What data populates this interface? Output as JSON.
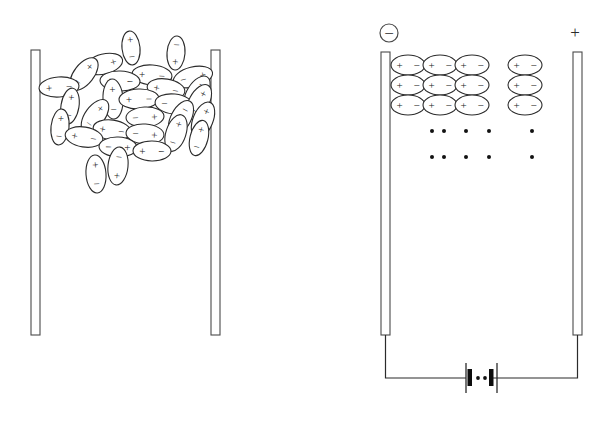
{
  "figure": {
    "panels": [
      {
        "id": "unpolarized",
        "name": "left-panel-unpolarized-dielectric",
        "description": "Randomly oriented polar molecules between two uncharged plates",
        "plates": [
          {
            "name": "left-plate",
            "x": 31,
            "y": 50,
            "width": 9,
            "height": 285
          },
          {
            "name": "right-plate",
            "x": 211,
            "y": 50,
            "width": 9,
            "height": 285
          }
        ],
        "dipole_count": 43,
        "dipole_charges": [
          "+",
          "−"
        ]
      },
      {
        "id": "polarized",
        "name": "right-panel-polarized-dielectric",
        "description": "Aligned dipoles between charged plates connected to a battery",
        "plates": [
          {
            "name": "negative-plate",
            "x": 381,
            "y": 52,
            "width": 9,
            "height": 283
          },
          {
            "name": "positive-plate",
            "x": 573,
            "y": 52,
            "width": 9,
            "height": 283
          }
        ],
        "terminals": [
          {
            "name": "negative-terminal",
            "label": "−",
            "circled": true,
            "x": 389,
            "y": 33
          },
          {
            "name": "positive-terminal",
            "label": "+",
            "circled": false,
            "x": 575,
            "y": 32
          }
        ],
        "dipole_rows": 3,
        "dipole_cols": 4,
        "dipole_charges": [
          "+",
          "−"
        ],
        "ion_dot_rows": 2,
        "ion_dot_cols": 5,
        "battery": {
          "name": "battery-symbol",
          "cells": 2,
          "x": 477,
          "y": 378
        }
      }
    ],
    "colors": {
      "ink": "#2b2b2b",
      "plate_stroke": "#4a4a4a",
      "background": "#ffffff",
      "dot": "#121212"
    }
  },
  "left_dipoles": [
    {
      "cx": 131,
      "cy": 48,
      "rx": 9,
      "ry": 17,
      "rot": -6,
      "plus": "+",
      "minus": "−"
    },
    {
      "cx": 176,
      "cy": 53,
      "rx": 9,
      "ry": 17,
      "rot": 4,
      "plus": "−",
      "minus": "+"
    },
    {
      "cx": 104,
      "cy": 64,
      "rx": 19,
      "ry": 10,
      "rot": -14,
      "plus": "−",
      "minus": "+"
    },
    {
      "cx": 152,
      "cy": 75,
      "rx": 20,
      "ry": 10,
      "rot": 4,
      "plus": "+",
      "minus": "−"
    },
    {
      "cx": 84,
      "cy": 74,
      "rx": 10,
      "ry": 19,
      "rot": 38,
      "plus": "+",
      "minus": "−"
    },
    {
      "cx": 193,
      "cy": 77,
      "rx": 20,
      "ry": 10,
      "rot": -14,
      "plus": "−",
      "minus": "+"
    },
    {
      "cx": 59,
      "cy": 87,
      "rx": 20,
      "ry": 10,
      "rot": -4,
      "plus": "+",
      "minus": "−"
    },
    {
      "cx": 120,
      "cy": 81,
      "rx": 20,
      "ry": 10,
      "rot": 2,
      "plus": "+",
      "minus": "−"
    },
    {
      "cx": 166,
      "cy": 89,
      "rx": 19,
      "ry": 10,
      "rot": 9,
      "plus": "+",
      "minus": "−"
    },
    {
      "cx": 197,
      "cy": 93,
      "rx": 10,
      "ry": 19,
      "rot": 32,
      "plus": "−",
      "minus": "+"
    },
    {
      "cx": 70,
      "cy": 106,
      "rx": 9,
      "ry": 18,
      "rot": 9,
      "plus": "+",
      "minus": "−"
    },
    {
      "cx": 113,
      "cy": 99,
      "rx": 10,
      "ry": 20,
      "rot": -3,
      "plus": "+",
      "minus": "−"
    },
    {
      "cx": 139,
      "cy": 99,
      "rx": 20,
      "ry": 10,
      "rot": -2,
      "plus": "+",
      "minus": "−"
    },
    {
      "cx": 174,
      "cy": 104,
      "rx": 19,
      "ry": 10,
      "rot": 6,
      "plus": "−",
      "minus": "+"
    },
    {
      "cx": 199,
      "cy": 102,
      "rx": 10,
      "ry": 19,
      "rot": 28,
      "plus": "+",
      "minus": "−"
    },
    {
      "cx": 95,
      "cy": 116,
      "rx": 10,
      "ry": 19,
      "rot": 36,
      "plus": "+",
      "minus": "−"
    },
    {
      "cx": 145,
      "cy": 117,
      "rx": 19,
      "ry": 10,
      "rot": -3,
      "plus": "−",
      "minus": "+"
    },
    {
      "cx": 181,
      "cy": 118,
      "rx": 10,
      "ry": 19,
      "rot": 28,
      "plus": "−",
      "minus": "+"
    },
    {
      "cx": 203,
      "cy": 120,
      "rx": 10,
      "ry": 19,
      "rot": 22,
      "plus": "+",
      "minus": "−"
    },
    {
      "cx": 60,
      "cy": 127,
      "rx": 9,
      "ry": 18,
      "rot": 6,
      "plus": "+",
      "minus": "−"
    },
    {
      "cx": 112,
      "cy": 130,
      "rx": 19,
      "ry": 10,
      "rot": 8,
      "plus": "+",
      "minus": "−"
    },
    {
      "cx": 145,
      "cy": 134,
      "rx": 19,
      "ry": 10,
      "rot": 4,
      "plus": "−",
      "minus": "+"
    },
    {
      "cx": 176,
      "cy": 133,
      "rx": 10,
      "ry": 19,
      "rot": 18,
      "plus": "+",
      "minus": "−"
    },
    {
      "cx": 199,
      "cy": 138,
      "rx": 9,
      "ry": 18,
      "rot": 14,
      "plus": "+",
      "minus": "−"
    },
    {
      "cx": 84,
      "cy": 137,
      "rx": 19,
      "ry": 10,
      "rot": 9,
      "plus": "+",
      "minus": "−"
    },
    {
      "cx": 118,
      "cy": 147,
      "rx": 19,
      "ry": 10,
      "rot": 2,
      "plus": "−",
      "minus": "+"
    },
    {
      "cx": 152,
      "cy": 151,
      "rx": 19,
      "ry": 10,
      "rot": 1,
      "plus": "+",
      "minus": "−"
    },
    {
      "cx": 118,
      "cy": 166,
      "rx": 10,
      "ry": 19,
      "rot": 6,
      "plus": "−",
      "minus": "+"
    },
    {
      "cx": 96,
      "cy": 174,
      "rx": 10,
      "ry": 19,
      "rot": -4,
      "plus": "+",
      "minus": "−"
    },
    {
      "cx": 73,
      "cy": 56,
      "rx": 0,
      "ry": 0,
      "rot": 0,
      "plus": "",
      "minus": ""
    }
  ],
  "right_dipoles": {
    "group_a_x": [
      408,
      440,
      472
    ],
    "group_b_x": [
      525
    ],
    "rows_y": [
      65,
      85,
      105
    ],
    "rx": 17,
    "ry": 10,
    "plus": "+",
    "minus": "−"
  },
  "ion_dots": {
    "rows_y": [
      131,
      157
    ],
    "cols_x": [
      432,
      444,
      466,
      489,
      532
    ],
    "radius": 2
  }
}
